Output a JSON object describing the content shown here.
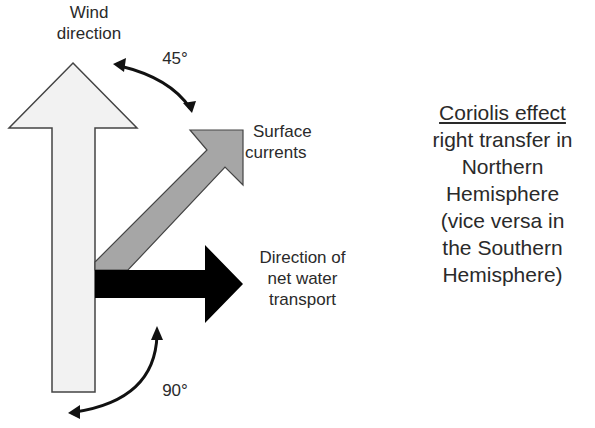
{
  "labels": {
    "wind": [
      "Wind",
      "direction"
    ],
    "angle_top": "45°",
    "surface": [
      "Surface",
      "currents"
    ],
    "transport": [
      "Direction of",
      "net water",
      "transport"
    ],
    "angle_bottom": "90°"
  },
  "side_note": {
    "title": "Coriolis effect",
    "lines": [
      "right transfer in",
      "Northern",
      "Hemisphere",
      "(vice versa in",
      "the Southern",
      "Hemisphere)"
    ]
  },
  "colors": {
    "wind_arrow_fill": "#f2f2f2",
    "surface_arrow_fill": "#a6a6a6",
    "transport_arrow_fill": "#000000",
    "outline": "#333333"
  }
}
